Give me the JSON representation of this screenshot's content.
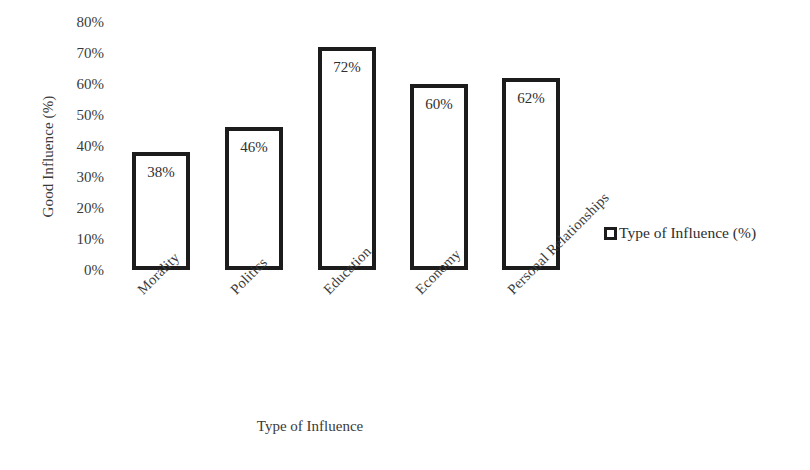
{
  "chart_data": {
    "type": "bar",
    "title": "",
    "subtitle": "",
    "categories": [
      "Morality",
      "Politics",
      "Education",
      "Economy",
      "Personal Relationships"
    ],
    "values": [
      38,
      46,
      72,
      60,
      62
    ],
    "data_labels": [
      "38%",
      "46%",
      "72%",
      "60%",
      "62%"
    ],
    "series": [
      {
        "name": "Type of Influence (%)",
        "values": [
          38,
          46,
          72,
          60,
          62
        ]
      }
    ],
    "xlabel": "Type of Influence",
    "ylabel": "Good Influence (%)",
    "ylim": [
      0,
      80
    ],
    "ytick_step": 10,
    "ytick_labels": [
      "80%",
      "70%",
      "60%",
      "50%",
      "40%",
      "30%",
      "20%",
      "10%",
      "0%"
    ],
    "ytick_values": [
      80,
      70,
      60,
      50,
      40,
      30,
      20,
      10,
      0
    ],
    "grid": false,
    "legend_position": "right",
    "legend_entries": [
      "Type of Influence (%)"
    ],
    "bar_fill_color": "#ffffff",
    "bar_border_color": "#1c1c1c",
    "background_color": "#ffffff",
    "text_color": "#3a3a3a",
    "category_label_rotation": -45
  },
  "axes": {
    "y_title": "Good Influence (%)",
    "x_title": "Type of Influence"
  },
  "legend": {
    "items": [
      {
        "label": "Type of Influence (%)",
        "swatch": "hollow-square-marker"
      }
    ]
  }
}
